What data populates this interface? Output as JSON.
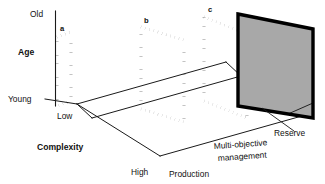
{
  "figure": {
    "type": "3d-conceptual-diagram",
    "title": "",
    "background_color": "#ffffff",
    "line_color": "#111111",
    "reserve_fill_color": "#a8a8a8"
  },
  "axes": {
    "vertical": {
      "name": "Age",
      "max_label": "Old",
      "min_label": "Young"
    },
    "depth": {
      "name": "Complexity",
      "min_label": "Low",
      "max_label": "High"
    },
    "horizontal": {
      "name": "Production",
      "far_label_line1": "Multi-objective",
      "far_label_line2": "management",
      "end_label": "Reserve"
    }
  },
  "panels": [
    {
      "id": "a",
      "label": "a",
      "kind": "dotted-parallelogram"
    },
    {
      "id": "b",
      "label": "b",
      "kind": "dotted-parallelogram"
    },
    {
      "id": "c",
      "label": "c",
      "kind": "dotted-parallelogram"
    }
  ],
  "reserve_panel": {
    "label": "Reserve",
    "fill": "#a8a8a8",
    "border": "#000000"
  }
}
